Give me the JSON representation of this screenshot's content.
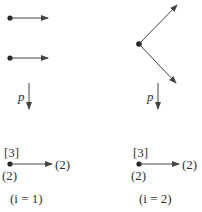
{
  "colors": {
    "stroke": "#444444",
    "text": "#333333",
    "background": "#ffffff"
  },
  "panels": [
    {
      "id": "i1",
      "top_arrows": [
        "arrow-1",
        "arrow-2"
      ],
      "map_label": "p",
      "bracket_label": "[3]",
      "node_label": "(2)",
      "target_label": "(2)",
      "caption": "(i = 1)"
    },
    {
      "id": "i2",
      "top_arrows": [
        "arrow-up",
        "arrow-down"
      ],
      "map_label": "p",
      "bracket_label": "[3]",
      "node_label": "(2)",
      "target_label": "(2)",
      "caption": "(i = 2)"
    }
  ]
}
